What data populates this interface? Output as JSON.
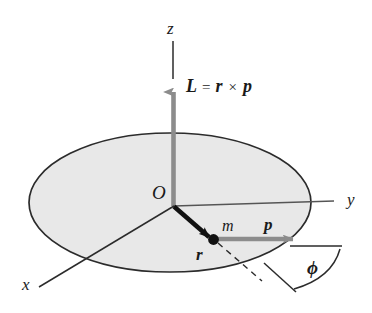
{
  "figure": {
    "background_color": "#ffffff",
    "ink_color": "#1a1a1a",
    "disk_fill_color": "#e8e8e8",
    "disk_edge_color": "#2b2b2b",
    "vector_gray_color": "#8c8c8c",
    "vector_black_color": "#111111"
  },
  "axes": {
    "z": {
      "label": "z"
    },
    "y": {
      "label": "y"
    },
    "x": {
      "label": "x"
    }
  },
  "origin": {
    "label": "O"
  },
  "vectors": {
    "angular_momentum": {
      "label": "L",
      "color": "#8c8c8c"
    },
    "position": {
      "label": "r",
      "color": "#111111"
    },
    "momentum": {
      "label": "p",
      "color": "#8c8c8c"
    }
  },
  "equation": {
    "lhs": "L",
    "equals": "=",
    "operand_a": "r",
    "cross": "×",
    "operand_b": "p"
  },
  "particle": {
    "label": "m"
  },
  "angle": {
    "label": "ϕ"
  }
}
